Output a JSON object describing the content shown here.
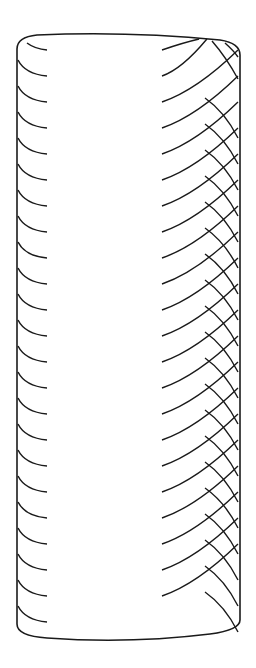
{
  "figure": {
    "stroke_color": "#1a1a1a",
    "background": "#ffffff",
    "cylinder": {
      "left_x": 17,
      "right_x": 240,
      "top_y": 37,
      "top_ellipse_ry": 12,
      "bottom_y": 640,
      "bottom_ellipse_ry": 16
    },
    "hatching": {
      "start_y": 50,
      "spacing": 26,
      "count": 23,
      "left_arc_length": 30,
      "front_line_start_x": 162,
      "back_line_start_x": 205
    }
  }
}
